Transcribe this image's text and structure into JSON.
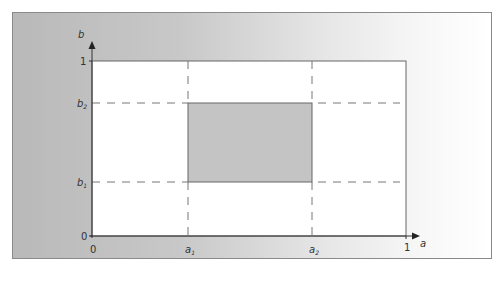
{
  "diagram": {
    "type": "unit-square-region",
    "axes": {
      "x": {
        "label": "a",
        "ticks": [
          "0",
          "a1",
          "a2",
          "1"
        ]
      },
      "y": {
        "label": "b",
        "ticks": [
          "0",
          "b1",
          "b2",
          "1"
        ]
      }
    },
    "labels": {
      "x_axis": "a",
      "y_axis": "b",
      "x_zero": "0",
      "x_a1_main": "a",
      "x_a1_sub": "1",
      "x_a2_main": "a",
      "x_a2_sub": "2",
      "x_one": "1",
      "y_zero": "0",
      "y_b1_main": "b",
      "y_b1_sub": "1",
      "y_b2_main": "b",
      "y_b2_sub": "2",
      "y_one": "1"
    },
    "region": {
      "x_from": "a1",
      "x_to": "a2",
      "y_from": "b1",
      "y_to": "b2",
      "fill": "#c4c4c4"
    },
    "colors": {
      "plot_bg": "#ffffff",
      "frame_left": "#b9b9b9",
      "frame_right": "#ffffff",
      "lines": "#555555",
      "dashes": "#777777"
    }
  }
}
